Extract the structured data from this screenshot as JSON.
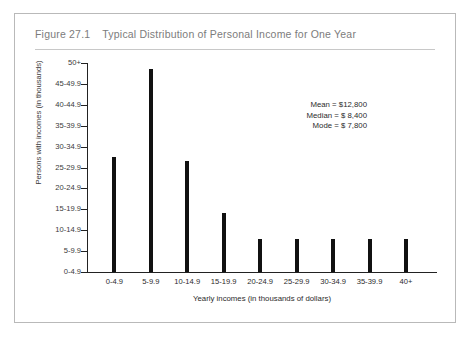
{
  "figure": {
    "number": "Figure 27.1",
    "title": "Typical Distribution of Personal Income for One Year"
  },
  "chart_data": {
    "type": "bar",
    "title": "Typical Distribution of Personal Income for One Year",
    "xlabel": "Yearly incomes (in thousands of dollars)",
    "ylabel": "Persons with incomes (in thousands)",
    "categories": [
      "0-4.9",
      "5-9.9",
      "10-14.9",
      "15-19.9",
      "20-24.9",
      "25-29.9",
      "30-34.9",
      "35-39.9",
      "40+"
    ],
    "values": [
      5.5,
      9.7,
      5.3,
      2.8,
      1.6,
      1.6,
      1.6,
      1.6,
      1.6
    ],
    "y_tick_labels": [
      "0-4.9",
      "5-9.9",
      "10-14.9",
      "15-19.9",
      "20-24.9",
      "25-29.9",
      "30-34.9",
      "35-39.9",
      "40-44.9",
      "45-49.9",
      "50+"
    ],
    "ylim": [
      0,
      11
    ],
    "grid": false,
    "legend": "none",
    "annotations": {
      "mean": "Mean = $12,800",
      "median": "Median = $ 8,400",
      "mode": "Mode = $ 7,800"
    }
  }
}
